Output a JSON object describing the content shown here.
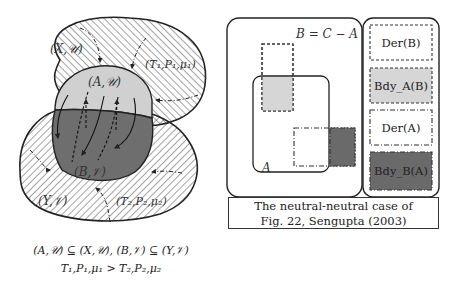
{
  "left_diagram": {
    "labels": {
      "xu": "(X,𝒰)",
      "au": "(A,𝒰)",
      "t1": "(T₁,P₁,μ₁)",
      "bv": "(B,𝒱)",
      "yv": "(Y,𝒱)",
      "t2": "(T₂,P₂,μ₂)"
    },
    "caption_line1": "(A,𝒰) ⊆ (X,𝒰), (B,𝒱) ⊆ (Y,𝒱)",
    "caption_line2": "T₁,P₁,μ₁ > T₂,P₂,μ₂",
    "colors": {
      "upper_region_fill": "#d0d0d0",
      "lower_region_fill": "#6e6e6e",
      "hatch": "#333333"
    }
  },
  "right_diagram": {
    "equation": "B = C − A",
    "set_a_label": "A",
    "legend": [
      {
        "label": "Der(B)",
        "fill": "#ffffff",
        "border": "dashed"
      },
      {
        "label": "Bdy_A(B)",
        "fill": "#d6d6d6",
        "border": "dashed"
      },
      {
        "label": "Der(A)",
        "fill": "#ffffff",
        "border": "dash-dot"
      },
      {
        "label": "Bdy_B(A)",
        "fill": "#6a6a6a",
        "border": "dash-dot"
      }
    ],
    "caption_line1": "The neutral-neutral case of",
    "caption_line2": "Fig. 22, Sengupta (2003)"
  }
}
